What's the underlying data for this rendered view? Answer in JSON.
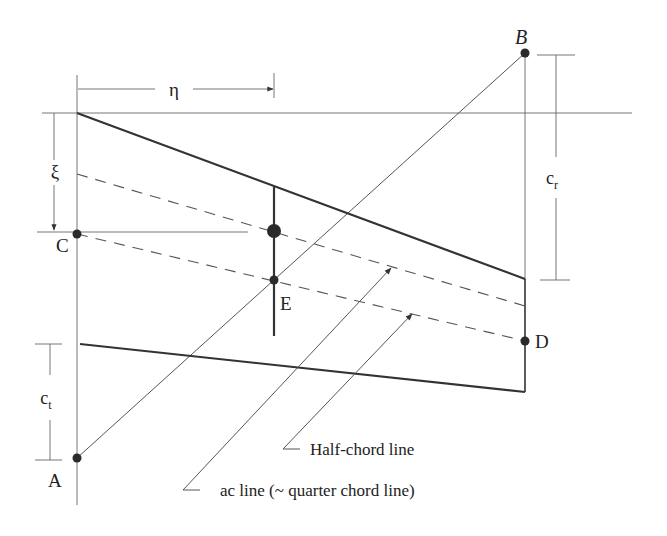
{
  "diagram": {
    "points": {
      "A": {
        "label": "A",
        "x": 77,
        "y": 458
      },
      "B": {
        "label": "B",
        "x": 525,
        "y": 53
      },
      "C": {
        "label": "C",
        "x": 77,
        "y": 234
      },
      "D": {
        "label": "D",
        "x": 525,
        "y": 341
      },
      "E": {
        "label": "E",
        "x": 274,
        "y": 280
      }
    },
    "dimensions": {
      "eta": {
        "label": "η"
      },
      "xi": {
        "label": "ξ"
      },
      "c_r": {
        "label": "c",
        "sub": "r"
      },
      "c_t": {
        "label": "c",
        "sub": "t"
      }
    },
    "annotations": {
      "half_chord": "Half-chord line",
      "ac_line": "ac line (~ quarter chord line)"
    },
    "colors": {
      "stroke": "#333333",
      "background": "#ffffff"
    }
  }
}
